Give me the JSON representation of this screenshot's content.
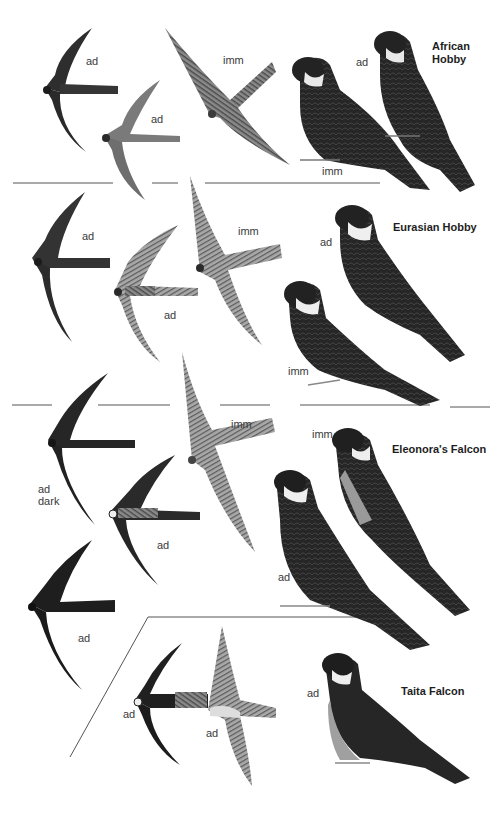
{
  "plate": {
    "colors": {
      "background": "#ffffff",
      "dark_plumage": "#2b2b2b",
      "mid_plumage": "#5e5e5e",
      "light_plumage": "#9a9a9a",
      "divider": "#555555"
    },
    "species": [
      {
        "name": "African Hobby",
        "labels": [
          "ad",
          "ad",
          "imm",
          "ad",
          "imm"
        ]
      },
      {
        "name": "Eurasian Hobby",
        "labels": [
          "ad",
          "ad",
          "imm",
          "ad",
          "imm"
        ]
      },
      {
        "name": "Eleonora's Falcon",
        "labels": [
          "ad\ndark",
          "ad",
          "imm",
          "ad",
          "imm",
          "ad"
        ]
      },
      {
        "name": "Taita Falcon",
        "labels": [
          "ad",
          "ad",
          "ad"
        ]
      }
    ],
    "text": {
      "african_title": "African\nHobby",
      "eurasian_title": "Eurasian Hobby",
      "eleonora_title": "Eleonora's Falcon",
      "taita_title": "Taita Falcon",
      "african_flight_dark_label": "ad",
      "african_flight_pale_label": "ad",
      "african_flight_imm_label": "imm",
      "african_perched_ad_label": "ad",
      "african_perched_imm_label": "imm",
      "eurasian_flight_dark_label": "ad",
      "eurasian_flight_streaked_label": "ad",
      "eurasian_flight_imm_label": "imm",
      "eurasian_perched_ad_label": "ad",
      "eurasian_perched_imm_label": "imm",
      "eleonora_flight_dark_label": "ad\ndark",
      "eleonora_flight_pale_label": "ad",
      "eleonora_flight_imm_label": "imm",
      "eleonora_flight_dark2_label": "ad",
      "eleonora_perched_imm_label": "imm",
      "eleonora_perched_ad_label": "ad",
      "taita_flight_under_label": "ad",
      "taita_flight_upper_label": "ad",
      "taita_perched_label": "ad"
    }
  }
}
